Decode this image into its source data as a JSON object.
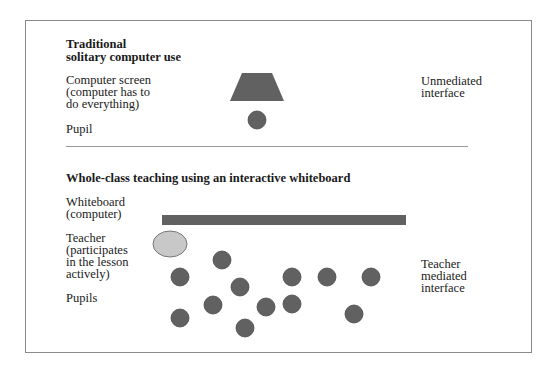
{
  "colors": {
    "shape_fill": "#616161",
    "shape_stroke": "#4a4a4a",
    "teacher_fill": "#c8c8c8",
    "teacher_stroke": "#777777",
    "frame": "#8a8a8a",
    "divider": "#9a9a9a"
  },
  "section_top": {
    "title_line1": "Traditional",
    "title_line2": "solitary computer use",
    "screen_label_line1": "Computer screen",
    "screen_label_line2": "(computer has to",
    "screen_label_line3": "do everything)",
    "pupil_label": "Pupil",
    "interface_label_line1": "Unmediated",
    "interface_label_line2": "interface"
  },
  "section_bottom": {
    "title": "Whole-class teaching using an interactive whiteboard",
    "whiteboard_label_line1": "Whiteboard",
    "whiteboard_label_line2": "(computer)",
    "teacher_label_line1": "Teacher",
    "teacher_label_line2": "(participates",
    "teacher_label_line3": "in the lesson",
    "teacher_label_line4": "actively)",
    "pupils_label": "Pupils",
    "interface_label_line1": "Teacher",
    "interface_label_line2": "mediated",
    "interface_label_line3": "interface"
  },
  "shapes": {
    "computer_screen": {
      "top_left": 242,
      "top_right": 272,
      "bottom_left": 230,
      "bottom_right": 284,
      "top_y": 73,
      "bottom_y": 101
    },
    "top_pupil": {
      "cx": 257,
      "cy": 120,
      "r": 9
    },
    "whiteboard": {
      "x": 162,
      "y": 215,
      "width": 244,
      "height": 10
    },
    "teacher": {
      "cx": 170,
      "cy": 244,
      "rx": 17,
      "ry": 13
    },
    "pupils": [
      {
        "cx": 180,
        "cy": 277
      },
      {
        "cx": 222,
        "cy": 260
      },
      {
        "cx": 240,
        "cy": 287
      },
      {
        "cx": 213,
        "cy": 305
      },
      {
        "cx": 266,
        "cy": 307
      },
      {
        "cx": 292,
        "cy": 277
      },
      {
        "cx": 292,
        "cy": 304
      },
      {
        "cx": 327,
        "cy": 277
      },
      {
        "cx": 371,
        "cy": 277
      },
      {
        "cx": 180,
        "cy": 318
      },
      {
        "cx": 245,
        "cy": 328
      },
      {
        "cx": 354,
        "cy": 314
      }
    ],
    "pupil_radius": 9
  }
}
